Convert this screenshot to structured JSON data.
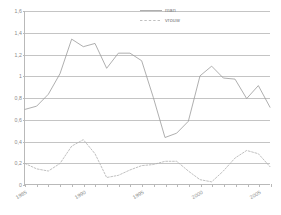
{
  "chart_data": {
    "type": "line",
    "title": "",
    "subtitle": "",
    "xlabel": "",
    "ylabel": "",
    "xlim": [
      1985,
      2006
    ],
    "ylim": [
      0,
      1.6
    ],
    "grid": true,
    "legend_position": "top-right",
    "y_ticks": [
      "0",
      "0,2",
      "0,4",
      "0,6",
      "0,8",
      "1",
      "1,2",
      "1,4",
      "1,6"
    ],
    "y_tick_values": [
      0,
      0.2,
      0.4,
      0.6,
      0.8,
      1,
      1.2,
      1.4,
      1.6
    ],
    "x_ticks": [
      "1985",
      "1990",
      "1995",
      "2000",
      "2005"
    ],
    "x_tick_values": [
      1985,
      1990,
      1995,
      2000,
      2005
    ],
    "x": [
      1985,
      1986,
      1987,
      1988,
      1989,
      1990,
      1991,
      1992,
      1993,
      1994,
      1995,
      1996,
      1997,
      1998,
      1999,
      2000,
      2001,
      2002,
      2003,
      2004,
      2005,
      2006
    ],
    "series": [
      {
        "name": "man",
        "style": "solid",
        "color": "#9a9a9a",
        "values": [
          0.69,
          0.72,
          0.83,
          1.02,
          1.34,
          1.27,
          1.3,
          1.07,
          1.21,
          1.21,
          1.14,
          0.8,
          0.43,
          0.47,
          0.58,
          1.0,
          1.09,
          0.98,
          0.97,
          0.79,
          0.91,
          0.71
        ]
      },
      {
        "name": "vrouw",
        "style": "dashed",
        "color": "#b0b0b0",
        "values": [
          0.19,
          0.14,
          0.12,
          0.19,
          0.35,
          0.41,
          0.28,
          0.06,
          0.08,
          0.13,
          0.17,
          0.18,
          0.21,
          0.21,
          0.12,
          0.04,
          0.02,
          0.12,
          0.24,
          0.31,
          0.28,
          0.16
        ]
      }
    ]
  },
  "legend": {
    "items": [
      {
        "label": "man",
        "style": "solid"
      },
      {
        "label": "vrouw",
        "style": "dashed"
      }
    ]
  }
}
